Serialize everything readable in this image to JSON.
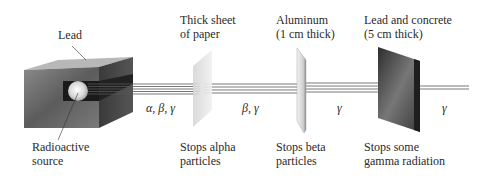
{
  "diagram": {
    "labels": {
      "lead": "Lead",
      "source_line1": "Radioactive",
      "source_line2": "source",
      "paper_line1": "Thick sheet",
      "paper_line2": "of paper",
      "paper_stop_line1": "Stops alpha",
      "paper_stop_line2": "particles",
      "aluminum_line1": "Aluminum",
      "aluminum_line2": "(1 cm thick)",
      "aluminum_stop_line1": "Stops beta",
      "aluminum_stop_line2": "particles",
      "concrete_line1": "Lead and concrete",
      "concrete_line2": "(5 cm thick)",
      "concrete_stop_line1": "Stops some",
      "concrete_stop_line2": "gamma radiation"
    },
    "beam_labels": {
      "seg1": "α, β, γ",
      "seg2": "β, γ",
      "seg3": "γ",
      "seg4": "γ"
    },
    "colors": {
      "lead_box": "#6e6e6e",
      "paper": "#e4e4e4",
      "aluminum": "#d8d8d8",
      "concrete": "#3a3a3a",
      "beam": "#555555"
    }
  }
}
